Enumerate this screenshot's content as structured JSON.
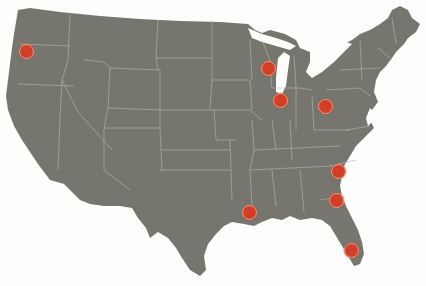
{
  "map": {
    "title": "United States location map",
    "land_color": "#76766f",
    "border_color": "#b9b8ad",
    "background_color": "#fdfdfc",
    "marker_fill": "#d23f26",
    "marker_ring": "#e9a488"
  },
  "markers": [
    {
      "id": "portland-or",
      "region": "Oregon",
      "x": 27,
      "y": 52
    },
    {
      "id": "wisconsin",
      "region": "Wisconsin",
      "x": 269,
      "y": 69
    },
    {
      "id": "chicago-il",
      "region": "Illinois",
      "x": 281,
      "y": 101
    },
    {
      "id": "ohio",
      "region": "Ohio",
      "x": 326,
      "y": 107
    },
    {
      "id": "south-carolina",
      "region": "South Carolina",
      "x": 339,
      "y": 172
    },
    {
      "id": "georgia",
      "region": "Georgia",
      "x": 337,
      "y": 201
    },
    {
      "id": "louisiana",
      "region": "Louisiana",
      "x": 250,
      "y": 213
    },
    {
      "id": "florida",
      "region": "Florida",
      "x": 352,
      "y": 251
    }
  ]
}
